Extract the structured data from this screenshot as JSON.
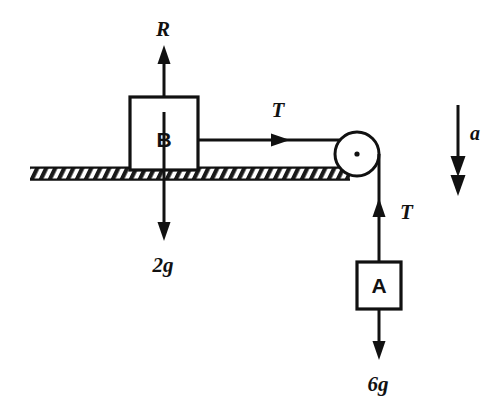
{
  "diagram": {
    "ink_color": "#111111",
    "background_color": "#ffffff",
    "blocks": [
      {
        "id": "block-b",
        "label": "B",
        "x": 130,
        "y": 97,
        "width": 68,
        "height": 73
      },
      {
        "id": "block-a",
        "label": "A",
        "x": 357,
        "y": 262,
        "width": 44,
        "height": 47
      }
    ],
    "forces": [
      {
        "id": "normal-reaction",
        "label": "R",
        "direction": "up",
        "applies_to": "B"
      },
      {
        "id": "tension-horizontal",
        "label": "T",
        "direction": "right",
        "applies_to": "B"
      },
      {
        "id": "weight-b",
        "label": "2g",
        "direction": "down",
        "applies_to": "B"
      },
      {
        "id": "tension-vertical",
        "label": "T",
        "direction": "up",
        "applies_to": "A"
      },
      {
        "id": "weight-a",
        "label": "6g",
        "direction": "down",
        "applies_to": "A"
      }
    ],
    "acceleration": {
      "id": "acceleration-indicator",
      "label": "a",
      "direction": "down",
      "arrowhead_style": "double"
    },
    "ground": {
      "id": "ground-surface",
      "hatched": true,
      "x": 30,
      "y": 167,
      "width": 320,
      "height": 13
    },
    "pulley": {
      "id": "pulley",
      "center_x": 357,
      "center_y": 154,
      "radius": 22,
      "has_center_dot": true
    }
  }
}
